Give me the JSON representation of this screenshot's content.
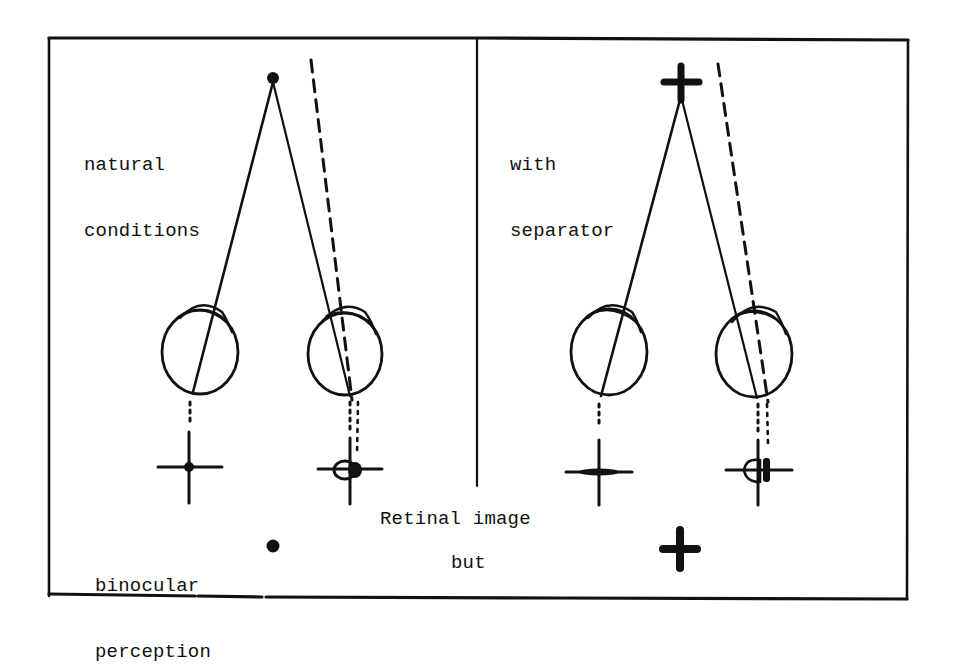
{
  "figure": {
    "type": "binocular vision diagram",
    "panels": [
      {
        "id": "natural",
        "title_lines": [
          "natural",
          "conditions"
        ],
        "fixation_target": "dot",
        "retinal_images": [
          "cross-with-dot-center",
          "cross-with-dot-and-offset-circle"
        ]
      },
      {
        "id": "separator",
        "title_lines": [
          "with",
          "separator"
        ],
        "fixation_target": "cross",
        "retinal_images": [
          "cross-thick-horizontal",
          "cross-with-offset-circle"
        ]
      }
    ],
    "center_label": "Retinal image",
    "bottom": {
      "perception_label_lines": [
        "binocular",
        "perception"
      ],
      "left_percept": "dot",
      "connector_label": "but",
      "right_percept": "cross"
    }
  },
  "colors": {
    "ink": "#111111",
    "paper": "#ffffff"
  }
}
